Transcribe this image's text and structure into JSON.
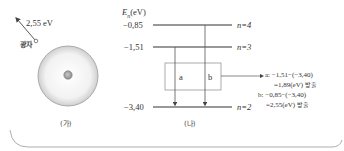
{
  "figure_a": {
    "photon_energy": "2,55 eV",
    "photon_label": "광자",
    "caption": "(가)"
  },
  "figure_b": {
    "axis_label_main": "E",
    "axis_label_sub": "n",
    "axis_label_unit": "(eV)",
    "levels": [
      {
        "energy": "−0,85",
        "n_label": "n=4"
      },
      {
        "energy": "−1,51",
        "n_label": "n=3"
      },
      {
        "energy": "−3,40",
        "n_label": "n=2"
      }
    ],
    "transitions": [
      {
        "label": "a"
      },
      {
        "label": "b"
      }
    ],
    "annotation": {
      "a_line1": "a: −1,51−(−3,40)",
      "a_line2": "=1,89(eV)",
      "a_emit": "방출",
      "b_line1": "b: −0,85−(−3,40)",
      "b_line2": "=2,55(eV)",
      "b_emit": "방출"
    },
    "caption": "(나)"
  }
}
